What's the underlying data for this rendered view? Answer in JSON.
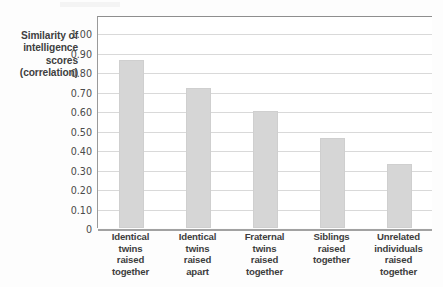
{
  "chart_data": {
    "type": "bar",
    "title": "",
    "xlabel": "",
    "ylabel": "Similarity of intelligence scores (correlation)",
    "ylabel_lines": [
      "Similarity of",
      "intelligence",
      "scores",
      "(correlation)"
    ],
    "categories": [
      "Identical twins raised together",
      "Identical twins raised apart",
      "Fraternal twins raised together",
      "Siblings raised together",
      "Unrelated individuals raised together"
    ],
    "category_lines": [
      [
        "Identical",
        "twins",
        "raised",
        "together"
      ],
      [
        "Identical",
        "twins",
        "raised",
        "apart"
      ],
      [
        "Fraternal",
        "twins",
        "raised",
        "together"
      ],
      [
        "Siblings",
        "raised",
        "together"
      ],
      [
        "Unrelated",
        "individuals",
        "raised",
        "together"
      ]
    ],
    "values": [
      0.86,
      0.72,
      0.6,
      0.46,
      0.33
    ],
    "ylim": [
      0,
      1.0
    ],
    "ytick_values": [
      1.0,
      0.9,
      0.8,
      0.7,
      0.6,
      0.5,
      0.4,
      0.3,
      0.2,
      0.1,
      0
    ],
    "ytick_labels": [
      "1.00",
      "0.90",
      "0.80",
      "0.70",
      "0.60",
      "0.50",
      "0.40",
      "0.30",
      "0.20",
      "0.10",
      "0"
    ],
    "grid": "horizontal",
    "legend": "none",
    "bar_color": "#d6d6d6",
    "gridline_color": "#d9d9d9",
    "axis_color": "#9a9a9a",
    "text_color": "#3e3d3d"
  }
}
